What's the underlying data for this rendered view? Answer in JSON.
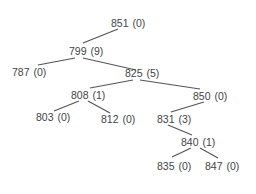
{
  "tree": {
    "nodes": [
      {
        "id": "851",
        "label": "851",
        "count": "(0)",
        "x": 111,
        "y": 17
      },
      {
        "id": "799",
        "label": "799",
        "count": "(9)",
        "x": 69,
        "y": 45
      },
      {
        "id": "787",
        "label": "787",
        "count": "(0)",
        "x": 12,
        "y": 66
      },
      {
        "id": "825",
        "label": "825",
        "count": "(5)",
        "x": 125,
        "y": 67
      },
      {
        "id": "808",
        "label": "808",
        "count": "(1)",
        "x": 71,
        "y": 89
      },
      {
        "id": "850",
        "label": "850",
        "count": "(0)",
        "x": 193,
        "y": 90
      },
      {
        "id": "803",
        "label": "803",
        "count": "(0)",
        "x": 36,
        "y": 111
      },
      {
        "id": "812",
        "label": "812",
        "count": "(0)",
        "x": 101,
        "y": 113
      },
      {
        "id": "831",
        "label": "831",
        "count": "(3)",
        "x": 157,
        "y": 113
      },
      {
        "id": "840",
        "label": "840",
        "count": "(1)",
        "x": 181,
        "y": 136
      },
      {
        "id": "835",
        "label": "835",
        "count": "(0)",
        "x": 157,
        "y": 160
      },
      {
        "id": "847",
        "label": "847",
        "count": "(0)",
        "x": 205,
        "y": 160
      }
    ],
    "edges": [
      {
        "from": "851",
        "to": "799"
      },
      {
        "from": "799",
        "to": "787"
      },
      {
        "from": "799",
        "to": "825"
      },
      {
        "from": "825",
        "to": "808"
      },
      {
        "from": "825",
        "to": "850"
      },
      {
        "from": "808",
        "to": "803"
      },
      {
        "from": "808",
        "to": "812"
      },
      {
        "from": "850",
        "to": "831"
      },
      {
        "from": "831",
        "to": "840"
      },
      {
        "from": "840",
        "to": "835"
      },
      {
        "from": "840",
        "to": "847"
      }
    ]
  }
}
